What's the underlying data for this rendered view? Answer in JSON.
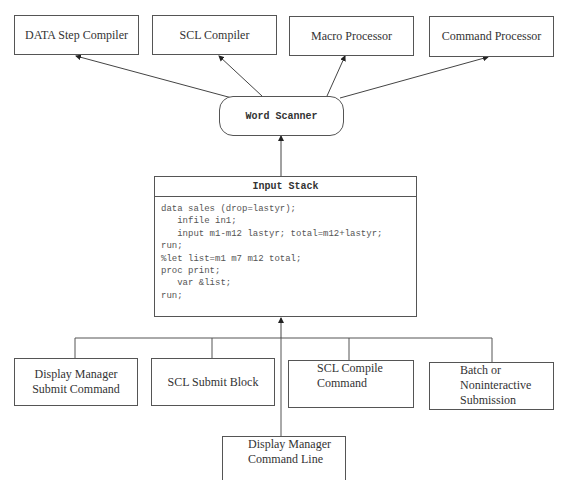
{
  "top_boxes": [
    {
      "label": "DATA Step Compiler"
    },
    {
      "label": "SCL Compiler"
    },
    {
      "label": "Macro Processor"
    },
    {
      "label": "Command Processor"
    }
  ],
  "word_scanner": {
    "label": "Word Scanner"
  },
  "input_stack": {
    "title": "Input Stack",
    "code_lines": [
      "data sales (drop=lastyr);",
      "   infile in1;",
      "   input m1-m12 lastyr; total=m12+lastyr;",
      "run;",
      "%let list=m1 m7 m12 total;",
      "proc print;",
      "   var &list;",
      "run;"
    ]
  },
  "bottom_boxes": [
    {
      "line1": "Display Manager",
      "line2": "Submit Command"
    },
    {
      "line1": "SCL Submit Block"
    },
    {
      "line1": "SCL Compile",
      "line2": "Command"
    },
    {
      "line1": "Batch or",
      "line2": "Noninteractive",
      "line3": "Submission"
    }
  ],
  "command_line_box": {
    "line1": "Display Manager",
    "line2": "Command Line"
  }
}
